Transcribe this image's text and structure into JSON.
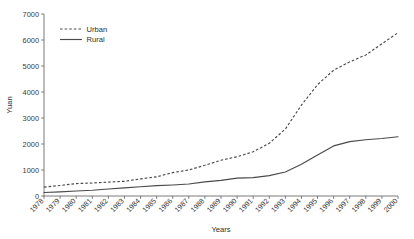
{
  "chart_data": {
    "type": "line",
    "title": "",
    "xlabel": "Years",
    "ylabel": "Yuan",
    "ylim": [
      0,
      7000
    ],
    "ytick_values": [
      0,
      1000,
      2000,
      3000,
      4000,
      5000,
      6000,
      7000
    ],
    "ytick_labels": [
      "0",
      "1000",
      "2000",
      "3000",
      "4000",
      "5000",
      "6000",
      "7000"
    ],
    "grid": false,
    "legend_position": "upper left",
    "categories": [
      "1978",
      "1979",
      "1980",
      "1981",
      "1982",
      "1983",
      "1984",
      "1985",
      "1986",
      "1987",
      "1988",
      "1989",
      "1990",
      "1991",
      "1992",
      "1993",
      "1994",
      "1995",
      "1996",
      "1997",
      "1998",
      "1999",
      "2000"
    ],
    "series": [
      {
        "name": "Urban",
        "style": "dashed",
        "color": "#4a4a4a",
        "values": [
          343,
          405,
          478,
          500,
          535,
          565,
          660,
          739,
          900,
          1002,
          1181,
          1376,
          1510,
          1700,
          2027,
          2577,
          3496,
          4283,
          4839,
          5160,
          5425,
          5854,
          6280
        ]
      },
      {
        "name": "Rural",
        "style": "solid",
        "color": "#4a4a4a",
        "values": [
          134,
          160,
          191,
          223,
          270,
          310,
          355,
          398,
          424,
          463,
          545,
          602,
          686,
          709,
          784,
          922,
          1221,
          1578,
          1926,
          2090,
          2162,
          2210,
          2280
        ]
      }
    ]
  },
  "legend": {
    "items": [
      {
        "label": "Urban",
        "style": "dashed"
      },
      {
        "label": "Rural",
        "style": "solid"
      }
    ]
  },
  "axes": {
    "x_title": "Years",
    "y_title": "Yuan"
  }
}
